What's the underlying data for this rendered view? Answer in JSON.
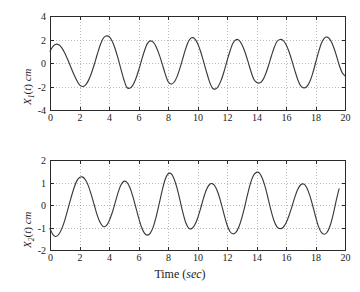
{
  "figure": {
    "background_color": "#ffffff",
    "curve_color": "#3a3a3a",
    "axis_color": "#2b2b2b",
    "grid_color": "#9a9a9a"
  },
  "chart_data": [
    {
      "type": "line",
      "id": "x1-vs-time",
      "title": "",
      "xlabel": "",
      "ylabel": "X1(t) cm",
      "ylabel_parts": {
        "var": "X",
        "sub": "1",
        "paren": "(",
        "arg": "t",
        "paren_close": ")",
        "unit": "cm"
      },
      "xlim": [
        0,
        20
      ],
      "ylim": [
        -4,
        4
      ],
      "xticks": [
        0,
        2,
        4,
        6,
        8,
        10,
        12,
        14,
        16,
        18,
        20
      ],
      "xticklabels": [
        "0",
        "2",
        "4",
        "6",
        "8",
        "10",
        "12",
        "14",
        "16",
        "18",
        "20"
      ],
      "yticks": [
        -4,
        -2,
        0,
        2,
        4
      ],
      "yticklabels": [
        "-4",
        "-2",
        "0",
        "2",
        "4"
      ],
      "grid": true,
      "legend": null,
      "series": [
        {
          "name": "X1(t)",
          "color": "#3a3a3a",
          "peaks": [
            [
              0.5,
              1.6
            ],
            [
              3.5,
              2.3
            ],
            [
              6.6,
              1.8
            ],
            [
              9.5,
              2.15
            ],
            [
              12.7,
              2.0
            ],
            [
              15.8,
              2.0
            ],
            [
              18.8,
              2.2
            ]
          ],
          "troughs": [
            [
              2.0,
              -1.9
            ],
            [
              5.0,
              -2.15
            ],
            [
              8.1,
              -1.75
            ],
            [
              11.2,
              -2.25
            ],
            [
              14.2,
              -1.7
            ],
            [
              17.3,
              -2.2
            ]
          ],
          "x": [
            0.0,
            0.2,
            0.4,
            0.6,
            0.8,
            1.0,
            1.2,
            1.4,
            1.6,
            1.8,
            2.0,
            2.2,
            2.4,
            2.6,
            2.8,
            3.0,
            3.2,
            3.4,
            3.6,
            3.8,
            4.0,
            4.2,
            4.4,
            4.6,
            4.8,
            5.0,
            5.2,
            5.4,
            5.6,
            5.8,
            6.0,
            6.2,
            6.4,
            6.6,
            6.8,
            7.0,
            7.2,
            7.4,
            7.6,
            7.8,
            8.0,
            8.2,
            8.4,
            8.6,
            8.8,
            9.0,
            9.2,
            9.4,
            9.6,
            9.8,
            10.0,
            10.2,
            10.4,
            10.6,
            10.8,
            11.0,
            11.2,
            11.4,
            11.6,
            11.8,
            12.0,
            12.2,
            12.4,
            12.6,
            12.8,
            13.0,
            13.2,
            13.4,
            13.6,
            13.8,
            14.0,
            14.2,
            14.4,
            14.6,
            14.8,
            15.0,
            15.2,
            15.4,
            15.6,
            15.8,
            16.0,
            16.2,
            16.4,
            16.6,
            16.8,
            17.0,
            17.2,
            17.4,
            17.6,
            17.8,
            18.0,
            18.2,
            18.4,
            18.6,
            18.8,
            19.0,
            19.2,
            19.4,
            19.6,
            19.8,
            20.0
          ],
          "y": [
            1.0,
            1.42,
            1.6,
            1.55,
            1.29,
            0.85,
            0.29,
            -0.32,
            -0.92,
            -1.45,
            -1.86,
            -2.0,
            -1.88,
            -1.5,
            -0.9,
            -0.13,
            0.72,
            1.51,
            2.09,
            2.3,
            2.25,
            1.9,
            1.28,
            0.45,
            -0.48,
            -1.38,
            -2.05,
            -2.15,
            -1.92,
            -1.4,
            -0.66,
            0.2,
            1.02,
            1.65,
            1.88,
            1.77,
            1.37,
            0.73,
            -0.05,
            -0.88,
            -1.58,
            -1.79,
            -1.66,
            -1.2,
            -0.48,
            0.38,
            1.22,
            1.88,
            2.15,
            2.08,
            1.68,
            1.02,
            0.18,
            -0.71,
            -1.54,
            -2.11,
            -2.22,
            -2.0,
            -1.48,
            -0.72,
            0.17,
            1.0,
            1.68,
            1.98,
            1.95,
            1.6,
            1.0,
            0.22,
            -0.62,
            -1.33,
            -1.64,
            -1.7,
            -1.5,
            -1.0,
            -0.28,
            0.55,
            1.32,
            1.85,
            2.0,
            1.93,
            1.58,
            0.98,
            0.2,
            -0.65,
            -1.42,
            -1.95,
            -2.12,
            -2.02,
            -1.62,
            -0.92,
            -0.02,
            0.9,
            1.68,
            2.12,
            2.2,
            1.97,
            1.45,
            0.7,
            -0.15,
            -0.8,
            -1.1
          ]
        }
      ]
    },
    {
      "type": "line",
      "id": "x2-vs-time",
      "title": "",
      "xlabel": "Time (sec)",
      "xlabel_parts": {
        "text": "Time",
        "paren": "(",
        "unit": "sec",
        "paren_close": ")"
      },
      "ylabel": "X2(t) cm",
      "ylabel_parts": {
        "var": "X",
        "sub": "2",
        "paren": "(",
        "arg": "t",
        "paren_close": ")",
        "unit": "cm"
      },
      "xlim": [
        0,
        20
      ],
      "ylim": [
        -2,
        2
      ],
      "xticks": [
        0,
        2,
        4,
        6,
        8,
        10,
        12,
        14,
        16,
        18,
        20
      ],
      "xticklabels": [
        "0",
        "2",
        "4",
        "6",
        "8",
        "10",
        "12",
        "14",
        "16",
        "18",
        "20"
      ],
      "yticks": [
        -2,
        -1,
        0,
        1,
        2
      ],
      "yticklabels": [
        "-2",
        "-1",
        "0",
        "1",
        "2"
      ],
      "grid": true,
      "legend": null,
      "series": [
        {
          "name": "X2(t)",
          "color": "#3a3a3a",
          "peaks": [
            [
              2.05,
              1.25
            ],
            [
              5.0,
              1.05
            ],
            [
              8.15,
              1.4
            ],
            [
              11.1,
              0.95
            ],
            [
              14.2,
              1.45
            ],
            [
              17.35,
              0.93
            ],
            [
              20.0,
              1.1
            ]
          ],
          "troughs": [
            [
              0.4,
              -1.4
            ],
            [
              3.5,
              -0.95
            ],
            [
              6.5,
              -1.35
            ],
            [
              9.6,
              -1.05
            ],
            [
              12.6,
              -1.25
            ],
            [
              15.8,
              -1.05
            ],
            [
              18.7,
              -1.3
            ]
          ],
          "x": [
            0.0,
            0.2,
            0.4,
            0.6,
            0.8,
            1.0,
            1.2,
            1.4,
            1.6,
            1.8,
            2.0,
            2.2,
            2.4,
            2.6,
            2.8,
            3.0,
            3.2,
            3.4,
            3.6,
            3.8,
            4.0,
            4.2,
            4.4,
            4.6,
            4.8,
            5.0,
            5.2,
            5.4,
            5.6,
            5.8,
            6.0,
            6.2,
            6.4,
            6.6,
            6.8,
            7.0,
            7.2,
            7.4,
            7.6,
            7.8,
            8.0,
            8.2,
            8.4,
            8.6,
            8.8,
            9.0,
            9.2,
            9.4,
            9.6,
            9.8,
            10.0,
            10.2,
            10.4,
            10.6,
            10.8,
            11.0,
            11.2,
            11.4,
            11.6,
            11.8,
            12.0,
            12.2,
            12.4,
            12.6,
            12.8,
            13.0,
            13.2,
            13.4,
            13.6,
            13.8,
            14.0,
            14.2,
            14.4,
            14.6,
            14.8,
            15.0,
            15.2,
            15.4,
            15.6,
            15.8,
            16.0,
            16.2,
            16.4,
            16.6,
            16.8,
            17.0,
            17.2,
            17.4,
            17.6,
            17.8,
            18.0,
            18.2,
            18.4,
            18.6,
            18.8,
            19.0,
            19.2,
            19.4,
            19.6,
            19.8,
            20.0
          ],
          "y": [
            -1.05,
            -1.32,
            -1.4,
            -1.3,
            -1.05,
            -0.68,
            -0.22,
            0.26,
            0.7,
            1.05,
            1.22,
            1.25,
            1.12,
            0.85,
            0.45,
            0.0,
            -0.45,
            -0.78,
            -0.95,
            -0.93,
            -0.72,
            -0.38,
            0.06,
            0.52,
            0.88,
            1.05,
            1.02,
            0.8,
            0.42,
            -0.06,
            -0.55,
            -0.98,
            -1.25,
            -1.34,
            -1.25,
            -0.97,
            -0.52,
            0.05,
            0.63,
            1.12,
            1.38,
            1.4,
            1.18,
            0.78,
            0.25,
            -0.32,
            -0.78,
            -1.03,
            -1.05,
            -0.9,
            -0.6,
            -0.18,
            0.28,
            0.68,
            0.9,
            0.95,
            0.82,
            0.52,
            0.08,
            -0.42,
            -0.88,
            -1.18,
            -1.28,
            -1.22,
            -0.98,
            -0.58,
            -0.08,
            0.48,
            0.98,
            1.32,
            1.45,
            1.42,
            1.18,
            0.78,
            0.25,
            -0.28,
            -0.72,
            -0.98,
            -1.05,
            -1.0,
            -0.8,
            -0.48,
            -0.08,
            0.35,
            0.7,
            0.9,
            0.93,
            0.78,
            0.45,
            0.0,
            -0.5,
            -0.95,
            -1.22,
            -1.3,
            -1.2,
            -0.9,
            -0.42,
            0.18,
            0.72,
            1.1
          ]
        }
      ]
    }
  ]
}
